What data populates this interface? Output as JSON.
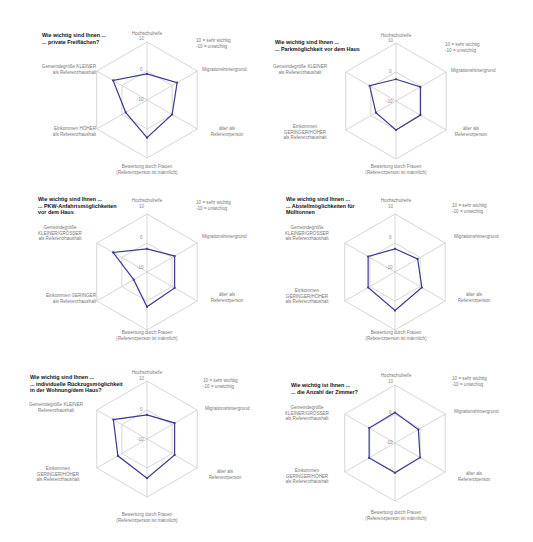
{
  "page": {
    "scale_legend": [
      "10 = sehr wichtig",
      "-10 = unwichtig"
    ],
    "ticks": [
      "10",
      "0",
      "-10"
    ]
  },
  "chart_data": [
    {
      "type": "radar",
      "title": "Wie wichtig sind Ihnen ...\n... private Freiflächen?",
      "axes": [
        "Hochschulreife",
        "Migrationshintergrund",
        "älter als\nReferenzperson",
        "Bewertung durch Frauen\n(Referenzperson ist männlich)",
        "Einkommen HÖHER\nals Referenzhaushalt",
        "Gemeindegröße KLEINER\nals Referenzhaushalt"
      ],
      "values": [
        -1,
        2,
        0,
        3,
        -1.5,
        3.5
      ],
      "range": [
        -10,
        10
      ],
      "ticks": [
        10,
        0,
        -10
      ]
    },
    {
      "type": "radar",
      "title": "Wie wichtig sind Ihnen ...\n... Parkmöglichkeit vor dem Haus",
      "axes": [
        "Hochschulreife",
        "Migrationshintergrund",
        "älter als\nReferenzperson",
        "Bewertung durch Frauen\n(Referenzperson ist männlich)",
        "Einkommen\nGERINGER/HÖHER\nals Referenzhaushalt",
        "Gemeindegröße KLEINER\nals Referenzhaushalt"
      ],
      "values": [
        -2.5,
        -0.3,
        -0.3,
        0,
        -2,
        0.5
      ],
      "range": [
        -10,
        10
      ],
      "ticks": [
        10,
        0,
        -10
      ]
    },
    {
      "type": "radar",
      "title": "Wie wichtig sind Ihnen ...\n... PKW-Anfahrtsmöglichkeiten\nvor dem Haus",
      "axes": [
        "Hochschulreife",
        "Migrationshintergrund",
        "älter als\nReferenzperson",
        "Bewertung durch Frauen\n(Referenzperson ist männlich)",
        "Einkommen GERINGER\nals Referenzhaushalt",
        "Gemeindegröße\nKLEINER/GRÖSSER\nals Referenzhaushalt"
      ],
      "values": [
        -2,
        1,
        1,
        2,
        -4.7,
        3.5
      ],
      "range": [
        -10,
        10
      ],
      "ticks": [
        10,
        0,
        -10
      ]
    },
    {
      "type": "radar",
      "title": "Wie wichtig sind Ihnen ...\n... Abstellmöglichkeiten für\nMülltonnen",
      "axes": [
        "Hochschulreife",
        "Migrationshintergrund",
        "älter als\nReferenzperson",
        "Bewertung durch Frauen\n(Referenzperson ist männlich)",
        "Einkommen\nGERINGER/HÖHER\nals Referenzhaushalt",
        "Gemeindegröße\nKLEINER/GRÖSSER\nals Referenzhaushalt"
      ],
      "values": [
        -2,
        -1,
        0.7,
        3.3,
        0.7,
        0.7
      ],
      "range": [
        -10,
        10
      ],
      "ticks": [
        10,
        0,
        -10
      ]
    },
    {
      "type": "radar",
      "title": "Wie wichtig sind Ihnen ...\n... individuelle Rückzugsmöglichkeit\nin der Wohnung/dem Haus?",
      "axes": [
        "Hochschulreife",
        "Migrationshintergrund",
        "älter als\nReferenzperson",
        "Bewertung durch Frauen\n(Referenzperson ist männlich)",
        "Einkommen\nGERINGER/HÖHER\nals Referenzhaushalt",
        "Gemeindegröße KLEINER\nReferenzhaushalt"
      ],
      "values": [
        -1.7,
        1,
        1,
        3.5,
        1.6,
        3.4
      ],
      "range": [
        -10,
        10
      ],
      "ticks": [
        10,
        0,
        -10
      ]
    },
    {
      "type": "radar",
      "title": "Wie wichtig ist Ihnen ...\n... die Anzahl der Zimmer?",
      "axes": [
        "Hochschulreife",
        "Migrationshintergrund",
        "älter als\nReferenzperson",
        "Bewertung durch Frauen\n(Referenzperson ist männlich)",
        "Einkommen\nGERINGER/HÖHER\nals Referenzhaushalt",
        "Gemeindegröße\nKLEINER/GRÖSSER\nals Referenzhaushalt"
      ],
      "values": [
        0.5,
        -0.7,
        0,
        0.3,
        0.3,
        0.3
      ],
      "range": [
        -10,
        10
      ],
      "ticks": [
        10,
        0,
        -10
      ]
    }
  ],
  "colors": {
    "series": "#3b3b8f",
    "grid": "#cccccc",
    "text": "#777777",
    "title": "#111111"
  }
}
